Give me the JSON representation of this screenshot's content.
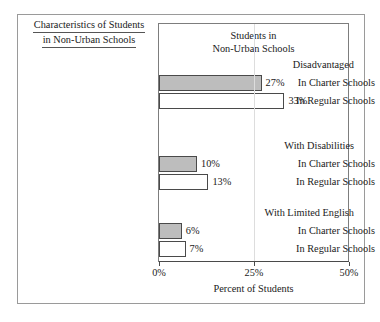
{
  "figure": {
    "caption_line1": "Characteristics of Students",
    "caption_line2": "in Non-Urban Schools",
    "panel_heading_line1": "Students in",
    "panel_heading_line2": "Non-Urban Schools"
  },
  "chart_data": {
    "type": "bar",
    "orientation": "horizontal",
    "title": "Students in Non-Urban Schools",
    "xlabel": "Percent of Students",
    "ylabel": "",
    "xlim": [
      0,
      50
    ],
    "xticks": [
      0,
      25,
      50
    ],
    "xticklabels": [
      "0%",
      "25%",
      "50%"
    ],
    "grid": true,
    "legend": "none",
    "value_suffix": "%",
    "colors": {
      "charter_fill": "#bdbdbd",
      "regular_fill": "#ffffff",
      "bar_outline": "#4a4a4a",
      "frame": "#7d7d7d",
      "figure_border": "#9a9a9a",
      "gridline": "#dddddd",
      "text": "#1a1a1a"
    },
    "groups": [
      {
        "name": "Disadvantaged",
        "bars": [
          {
            "series": "In Charter Schools",
            "value": 27,
            "label": "27%"
          },
          {
            "series": "In Regular Schools",
            "value": 33,
            "label": "33%"
          }
        ]
      },
      {
        "name": "With Disabilities",
        "bars": [
          {
            "series": "In Charter Schools",
            "value": 10,
            "label": "10%"
          },
          {
            "series": "In Regular Schools",
            "value": 13,
            "label": "13%"
          }
        ]
      },
      {
        "name": "With Limited English",
        "bars": [
          {
            "series": "In Charter Schools",
            "value": 6,
            "label": "6%"
          },
          {
            "series": "In Regular Schools",
            "value": 7,
            "label": "7%"
          }
        ]
      }
    ]
  }
}
